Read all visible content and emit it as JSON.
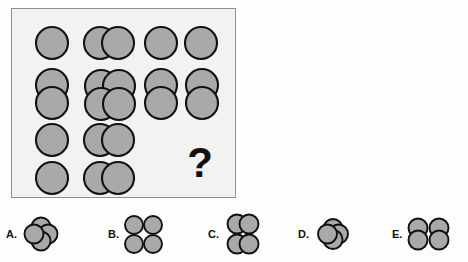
{
  "puzzle": {
    "type": "visual-analogy-matrix",
    "title": "",
    "question_mark": "?",
    "colors": {
      "circle_fill": "#a9a9a9",
      "circle_stroke": "#111111",
      "panel_background": "#f2f2f0",
      "panel_border": "#8e8e8e",
      "page_background": "#fdfdfd"
    },
    "matrix": {
      "rows": 3,
      "cols": 3,
      "cells": [
        {
          "id": "cell-r1c1",
          "row": 1,
          "col": 1,
          "description": "one circle",
          "circle_count": 1,
          "arrangement": "single",
          "overlapping": false,
          "missing": false
        },
        {
          "id": "cell-r1c2",
          "row": 1,
          "col": 2,
          "description": "two circles overlapping horizontally",
          "circle_count": 2,
          "arrangement": "horizontal-pair",
          "overlapping": true,
          "missing": false
        },
        {
          "id": "cell-r1c3",
          "row": 1,
          "col": 3,
          "description": "two separate circles side by side",
          "circle_count": 2,
          "arrangement": "horizontal-pair",
          "overlapping": false,
          "missing": false
        },
        {
          "id": "cell-r2c1",
          "row": 2,
          "col": 1,
          "description": "two circles overlapping vertically",
          "circle_count": 2,
          "arrangement": "vertical-pair",
          "overlapping": true,
          "missing": false
        },
        {
          "id": "cell-r2c2",
          "row": 2,
          "col": 2,
          "description": "four circles overlapping in a rosette",
          "circle_count": 4,
          "arrangement": "rosette",
          "overlapping": true,
          "missing": false
        },
        {
          "id": "cell-r2c3",
          "row": 2,
          "col": 3,
          "description": "two vertically overlapping pairs placed side by side",
          "circle_count": 4,
          "arrangement": "two-vertical-pairs",
          "overlapping": true,
          "missing": false
        },
        {
          "id": "cell-r3c1",
          "row": 3,
          "col": 1,
          "description": "two separate circles stacked vertically",
          "circle_count": 2,
          "arrangement": "vertical-pair",
          "overlapping": false,
          "missing": false
        },
        {
          "id": "cell-r3c2",
          "row": 3,
          "col": 2,
          "description": "two horizontally overlapping pairs stacked vertically",
          "circle_count": 4,
          "arrangement": "two-horizontal-pairs",
          "overlapping": true,
          "missing": false
        },
        {
          "id": "cell-r3c3",
          "row": 3,
          "col": 3,
          "description": "missing cell marked with a question mark",
          "circle_count": 0,
          "arrangement": "unknown",
          "overlapping": false,
          "missing": true
        }
      ]
    },
    "options": [
      {
        "id": "option-A",
        "label": "A.",
        "description": "four circles overlapping in a rosette, wide spread",
        "circle_count": 4,
        "arrangement": "rosette-wide",
        "overlapping": true
      },
      {
        "id": "option-B",
        "label": "B.",
        "description": "four separate circles in a 2x2 grid",
        "circle_count": 4,
        "arrangement": "grid-2x2",
        "overlapping": false
      },
      {
        "id": "option-C",
        "label": "C.",
        "description": "two horizontally overlapping pairs stacked vertically",
        "circle_count": 4,
        "arrangement": "two-horizontal-pairs",
        "overlapping": true
      },
      {
        "id": "option-D",
        "label": "D.",
        "description": "four circles overlapping in a tight rosette",
        "circle_count": 4,
        "arrangement": "rosette-tight",
        "overlapping": true
      },
      {
        "id": "option-E",
        "label": "E.",
        "description": "two vertically overlapping pairs placed side by side",
        "circle_count": 4,
        "arrangement": "two-vertical-pairs",
        "overlapping": true
      }
    ]
  }
}
